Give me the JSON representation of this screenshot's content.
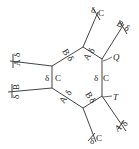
{
  "diagram": {
    "hexagon": {
      "vertices": [
        [
          83,
          47
        ],
        [
          102,
          59
        ],
        [
          102,
          96
        ],
        [
          83,
          108
        ],
        [
          52,
          88
        ],
        [
          52,
          66
        ]
      ]
    },
    "spokes": [
      {
        "from": [
          83,
          47
        ],
        "to": [
          98,
          12
        ],
        "labels": [
          "δ",
          "C"
        ]
      },
      {
        "from": [
          102,
          59
        ],
        "to": [
          124,
          24
        ],
        "labels": [
          "B",
          "δ"
        ]
      },
      {
        "from": [
          52,
          66
        ],
        "to": [
          10,
          61
        ],
        "labels": [
          "A",
          "δ"
        ]
      },
      {
        "from": [
          52,
          88
        ],
        "to": [
          8,
          92
        ],
        "labels": [
          "δ",
          "B"
        ]
      },
      {
        "from": [
          83,
          108
        ],
        "to": [
          96,
          142
        ],
        "labels": [
          "δ",
          "C"
        ]
      },
      {
        "from": [
          102,
          96
        ],
        "to": [
          126,
          131
        ],
        "labels": [
          "A",
          "δ"
        ]
      }
    ],
    "edge_labels": {
      "top_left_edge": [
        "B",
        "δ"
      ],
      "top_right_edge": [
        "A",
        "δ"
      ],
      "bottom_left_edge": [
        "A",
        "δ"
      ],
      "bottom_right_edge": [
        "B",
        "δ"
      ],
      "left_side": [
        "δ",
        "C"
      ],
      "right_side": [
        "δ",
        "C"
      ]
    },
    "markers": {
      "Q": "Q",
      "T": "T"
    },
    "label_texts": {
      "top_spoke_d": "δ",
      "top_spoke_c": "C",
      "tr_spoke_b": "B",
      "tr_spoke_d": "δ",
      "lt_spoke_a": "A",
      "lt_spoke_d": "δ",
      "lb_spoke_d": "δ",
      "lb_spoke_b": "B",
      "bot_spoke_d": "δ",
      "bot_spoke_c": "C",
      "br_spoke_a": "A",
      "br_spoke_d": "δ",
      "tl_edge_b": "B",
      "tl_edge_d": "δ",
      "tr_edge_a": "A",
      "tr_edge_d": "δ",
      "bl_edge_a": "A",
      "bl_edge_d": "δ",
      "br_edge_b": "B",
      "br_edge_d": "δ",
      "left_d": "δ",
      "left_c": "C",
      "right_d": "δ",
      "right_c": "C",
      "q": "Q",
      "t": "T"
    }
  }
}
